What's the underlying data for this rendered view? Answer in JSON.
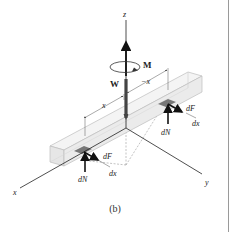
{
  "figure": {
    "caption": "(b)",
    "labels": {
      "z_axis": "z",
      "x_axis": "x",
      "y_axis": "y",
      "moment": "M",
      "weight": "W",
      "dim_left": "x",
      "dim_right": "−x",
      "dF_left": "dF",
      "dx_left": "dx",
      "dN_left": "dN",
      "dF_right": "dF",
      "dx_right": "dx",
      "dN_right": "dN"
    },
    "colors": {
      "beam_fill": "#eeeeee",
      "beam_edge": "#bdbdbd",
      "patch": "#777777",
      "arrow": "#111111",
      "weight_bar": "#444444",
      "axis": "#222222",
      "dashed": "#9a9a9a"
    }
  }
}
